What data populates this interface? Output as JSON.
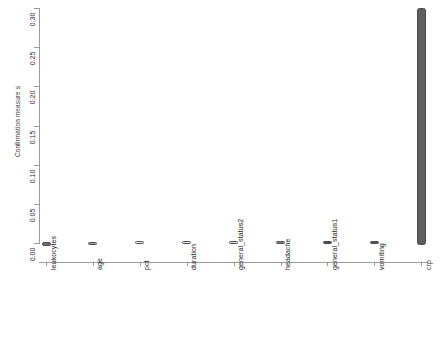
{
  "chart_data": {
    "type": "bar",
    "title": "",
    "subtitle": "",
    "xlabel": "",
    "ylabel": "Confirmation measure s",
    "ylim": [
      0.0,
      0.3
    ],
    "yticks": [
      "0.00",
      "0.05",
      "0.10",
      "0.15",
      "0.20",
      "0.25",
      "0.30"
    ],
    "ytick_values": [
      0.0,
      0.05,
      0.1,
      0.15,
      0.2,
      0.25,
      0.3
    ],
    "grid": false,
    "legend": "none",
    "categories": [
      "leukocytes",
      "age",
      "pct",
      "duration",
      "general_status2",
      "headache",
      "general_status1",
      "vomiting",
      "crp"
    ],
    "values": [
      0.0,
      0.0,
      0.0,
      0.0,
      0.0,
      0.0,
      0.0,
      0.0,
      0.3
    ],
    "boxes": [
      {
        "label": "leukocytes",
        "low": -0.004,
        "high": 0.001,
        "fill": "#6e6e6e"
      },
      {
        "label": "age",
        "low": -0.002,
        "high": 0.0015,
        "fill": "#a8a8a8"
      },
      {
        "label": "pct",
        "low": -0.001,
        "high": 0.002,
        "fill": "#fbfbfb"
      },
      {
        "label": "duration",
        "low": -0.001,
        "high": 0.002,
        "fill": "#f2f2f2"
      },
      {
        "label": "general_status2",
        "low": -0.001,
        "high": 0.002,
        "fill": "#e6e6e6"
      },
      {
        "label": "headache",
        "low": -0.001,
        "high": 0.002,
        "fill": "#8c8c8c"
      },
      {
        "label": "general_status1",
        "low": -0.001,
        "high": 0.002,
        "fill": "#4f4f4f"
      },
      {
        "label": "vomiting",
        "low": -0.001,
        "high": 0.002,
        "fill": "#585858"
      },
      {
        "label": "crp",
        "low": -0.003,
        "high": 0.3,
        "fill": "#5f5f5f"
      }
    ],
    "axis_color": "#9a9a9a",
    "text_color": "#1d1d1d"
  }
}
